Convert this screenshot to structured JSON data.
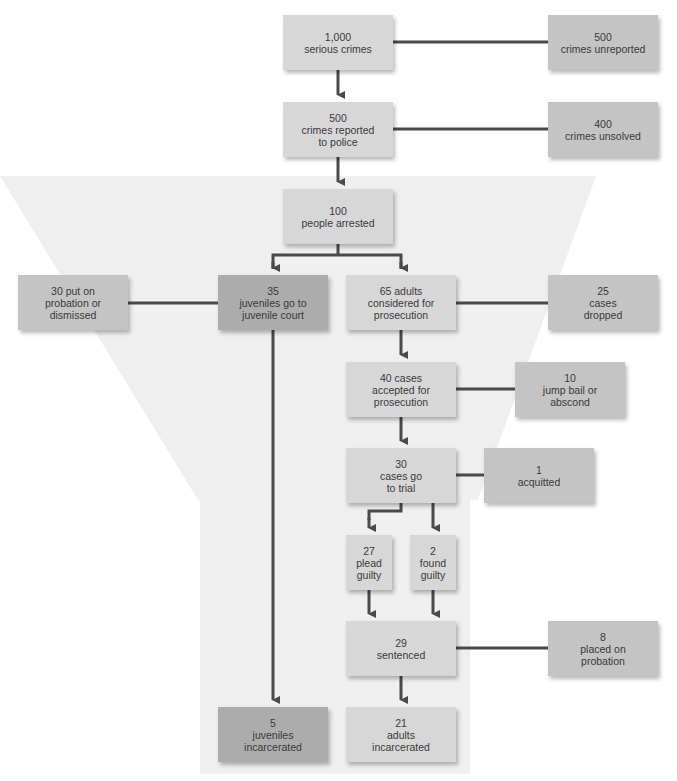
{
  "diagram": {
    "title": "",
    "colors": {
      "funnel": "#efefef",
      "line": "#4a4a4a",
      "box_main": "#d7d7d7",
      "box_side": "#c4c4c4",
      "box_juvenile": "#acacac"
    },
    "nodes": {
      "serious_crimes": {
        "num": "1,000",
        "text": "serious crimes"
      },
      "unreported": {
        "num": "500",
        "text": "crimes unreported"
      },
      "reported": {
        "num": "500",
        "text": "crimes reported to police"
      },
      "unsolved": {
        "num": "400",
        "text": "crimes unsolved"
      },
      "arrested": {
        "num": "100",
        "text": "people arrested"
      },
      "probation_dismissed": {
        "num": "",
        "text": "30 put on probation or dismissed"
      },
      "juvenile_court": {
        "num": "35",
        "text": "juveniles go to juvenile court"
      },
      "adults_considered": {
        "num": "",
        "text": "65 adults considered for prosecution"
      },
      "dropped": {
        "num": "25",
        "text": "cases dropped"
      },
      "accepted": {
        "num": "",
        "text": "40 cases accepted for prosecution"
      },
      "jump_bail": {
        "num": "10",
        "text": "jump bail or abscond"
      },
      "trial": {
        "num": "30",
        "text": "cases go to trial"
      },
      "acquitted": {
        "num": "1",
        "text": "acquitted"
      },
      "plead_guilty": {
        "num": "27",
        "text": "plead guilty"
      },
      "found_guilty": {
        "num": "2",
        "text": "found guilty"
      },
      "sentenced": {
        "num": "29",
        "text": "sentenced"
      },
      "placed_probation": {
        "num": "8",
        "text": "placed on probation"
      },
      "juveniles_incarcerated": {
        "num": "5",
        "text": "juveniles incarcerated"
      },
      "adults_incarcerated": {
        "num": "21",
        "text": "adults incarcerated"
      }
    },
    "edges": [
      {
        "from": "serious_crimes",
        "to": "unreported",
        "type": "line"
      },
      {
        "from": "serious_crimes",
        "to": "reported",
        "type": "arrow"
      },
      {
        "from": "reported",
        "to": "unsolved",
        "type": "line"
      },
      {
        "from": "reported",
        "to": "arrested",
        "type": "arrow"
      },
      {
        "from": "arrested",
        "to": "juvenile_court",
        "type": "arrow"
      },
      {
        "from": "arrested",
        "to": "adults_considered",
        "type": "arrow"
      },
      {
        "from": "juvenile_court",
        "to": "probation_dismissed",
        "type": "line"
      },
      {
        "from": "juvenile_court",
        "to": "juveniles_incarcerated",
        "type": "arrow"
      },
      {
        "from": "adults_considered",
        "to": "dropped",
        "type": "line"
      },
      {
        "from": "adults_considered",
        "to": "accepted",
        "type": "arrow"
      },
      {
        "from": "accepted",
        "to": "jump_bail",
        "type": "line"
      },
      {
        "from": "accepted",
        "to": "trial",
        "type": "arrow"
      },
      {
        "from": "trial",
        "to": "acquitted",
        "type": "line"
      },
      {
        "from": "trial",
        "to": "plead_guilty",
        "type": "arrow"
      },
      {
        "from": "trial",
        "to": "found_guilty",
        "type": "arrow"
      },
      {
        "from": "plead_guilty",
        "to": "sentenced",
        "type": "arrow"
      },
      {
        "from": "found_guilty",
        "to": "sentenced",
        "type": "arrow"
      },
      {
        "from": "sentenced",
        "to": "placed_probation",
        "type": "line"
      },
      {
        "from": "sentenced",
        "to": "adults_incarcerated",
        "type": "arrow"
      }
    ]
  }
}
